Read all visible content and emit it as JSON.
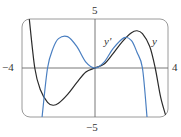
{
  "chart_data": {
    "type": "line",
    "title": "",
    "xlabel": "",
    "ylabel": "",
    "xlim": [
      -4,
      4
    ],
    "ylim": [
      -5,
      5
    ],
    "grid": false,
    "tick_labels": {
      "x_min": "−4",
      "x_max": "4",
      "y_max": "5",
      "y_min": "−5"
    },
    "series": [
      {
        "name": "y",
        "color": "#2b2b2b",
        "x": [
          -3.6,
          -3.3,
          -3.0,
          -2.6,
          -2.3,
          -2.0,
          -1.5,
          -1.0,
          -0.5,
          0,
          0.5,
          1.0,
          1.5,
          2.0,
          2.3,
          2.6,
          3.0,
          3.3,
          3.6,
          3.9
        ],
        "values": [
          5.0,
          0.0,
          -2.2,
          -3.5,
          -3.8,
          -3.6,
          -2.7,
          -1.5,
          -0.4,
          0,
          0.4,
          1.5,
          2.7,
          3.6,
          3.8,
          3.5,
          2.2,
          0.0,
          -3.0,
          -5.0
        ]
      },
      {
        "name": "y'",
        "color": "#4a7fc1",
        "x": [
          -2.9,
          -2.6,
          -2.3,
          -2.0,
          -1.5,
          -1.0,
          -0.5,
          0,
          0.5,
          1.0,
          1.6,
          2.0,
          2.3,
          2.6,
          2.85
        ],
        "values": [
          -5.0,
          0.0,
          2.0,
          3.0,
          3.2,
          2.2,
          0.6,
          0,
          0.6,
          2.0,
          3.1,
          2.8,
          1.6,
          0.0,
          -5.0
        ]
      }
    ],
    "annotations": [
      {
        "text": "y'",
        "x": 1.2,
        "y": 2.9
      },
      {
        "text": "y",
        "x": 3.35,
        "y": 2.9
      }
    ]
  },
  "colors": {
    "frame": "#8a8a8a",
    "axis": "#6a6a6a",
    "y_curve": "#2b2b2b",
    "yprime_curve": "#4a7fc1"
  }
}
